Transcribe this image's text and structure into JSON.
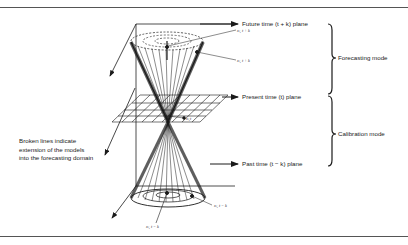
{
  "diagram": {
    "planes": {
      "future": "Future time (t + k) plane",
      "present": "Present time (t) plane",
      "past": "Past time (t − k) plane"
    },
    "modes": {
      "forecasting": "Forecasting mode",
      "calibration": "Calibration mode"
    },
    "point_labels": {
      "future_center": "xₗ, t + k",
      "future_edge": "xₗ, t + k",
      "present": "xₗ,t",
      "past_edge": "xₗ, t − k",
      "past_center": "xₗ, t − k"
    },
    "note_lines": [
      "Broken lines indicate",
      "extension of the models",
      "into the forecasting domain"
    ],
    "colors": {
      "ink": "#1a1a1a",
      "background": "#ffffff",
      "frame": "#555555"
    }
  }
}
